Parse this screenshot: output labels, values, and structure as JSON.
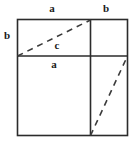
{
  "figure": {
    "stroke_color": "#2b2b2b",
    "dash_color": "#4a4a4a",
    "background_color": "#ffffff",
    "labels": {
      "a_top": "a",
      "b_top": "b",
      "b_left": "b",
      "c_hypotenuse": "c",
      "a_middle": "a"
    },
    "geometry": {
      "outer_square": {
        "x": 17,
        "y": 19,
        "width": 111,
        "height": 117
      },
      "internal_vertical_line": {
        "x": 90,
        "y1": 19,
        "y2": 136
      },
      "internal_horizontal_line": {
        "y": 56,
        "x1": 17,
        "x2": 128
      },
      "dashed_hypotenuse_c": {
        "x1": 17,
        "y1": 56,
        "x2": 90,
        "y2": 19
      },
      "dashed_hypotenuse_right": {
        "x1": 90,
        "y1": 136,
        "x2": 128,
        "y2": 56
      }
    },
    "segment_lengths": {
      "a": "long side",
      "b": "short side",
      "c": "hypotenuse"
    }
  }
}
